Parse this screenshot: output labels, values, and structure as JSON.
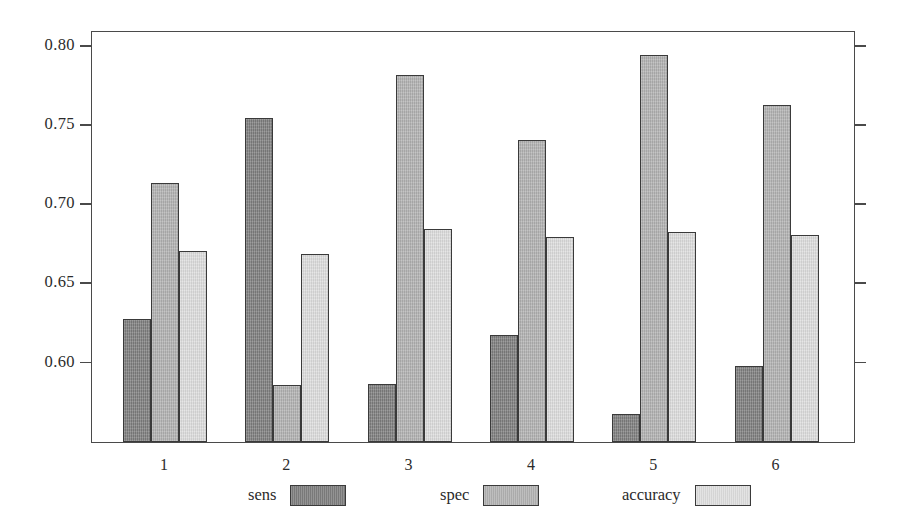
{
  "chart_data": {
    "type": "bar",
    "title": "",
    "subtitle": "",
    "xlabel": "",
    "ylabel": "",
    "categories": [
      "1",
      "2",
      "3",
      "4",
      "5",
      "6"
    ],
    "series": [
      {
        "name": "sens",
        "color": "#7e7e7e",
        "values": [
          0.627,
          0.754,
          0.586,
          0.617,
          0.567,
          0.597
        ]
      },
      {
        "name": "spec",
        "color": "#b2b2b2",
        "values": [
          0.713,
          0.585,
          0.781,
          0.74,
          0.794,
          0.762
        ]
      },
      {
        "name": "accuracy",
        "color": "#dedede",
        "values": [
          0.67,
          0.668,
          0.684,
          0.679,
          0.682,
          0.68
        ]
      }
    ],
    "ytick_labels": [
      "0.80",
      "0.75",
      "0.70",
      "0.65",
      "0.60"
    ],
    "ytick_values": [
      0.8,
      0.75,
      0.7,
      0.65,
      0.6
    ],
    "ylim": [
      0.5492,
      0.8095
    ],
    "xlim_note": "six grouped categories",
    "grid": false,
    "legend_position": "bottom-center",
    "right_axis_ticks": true,
    "right_axis_labels": false
  },
  "axes": {
    "y_ticks": [
      {
        "label": "0.80",
        "value": 0.8
      },
      {
        "label": "0.75",
        "value": 0.75
      },
      {
        "label": "0.70",
        "value": 0.7
      },
      {
        "label": "0.65",
        "value": 0.65
      },
      {
        "label": "0.60",
        "value": 0.6
      }
    ],
    "x_ticks": [
      {
        "label": "1"
      },
      {
        "label": "2"
      },
      {
        "label": "3"
      },
      {
        "label": "4"
      },
      {
        "label": "5"
      },
      {
        "label": "6"
      }
    ]
  },
  "legend": {
    "entries": [
      {
        "label": "sens",
        "color": "#7e7e7e"
      },
      {
        "label": "spec",
        "color": "#b2b2b2"
      },
      {
        "label": "accuracy",
        "color": "#dedede"
      }
    ]
  }
}
